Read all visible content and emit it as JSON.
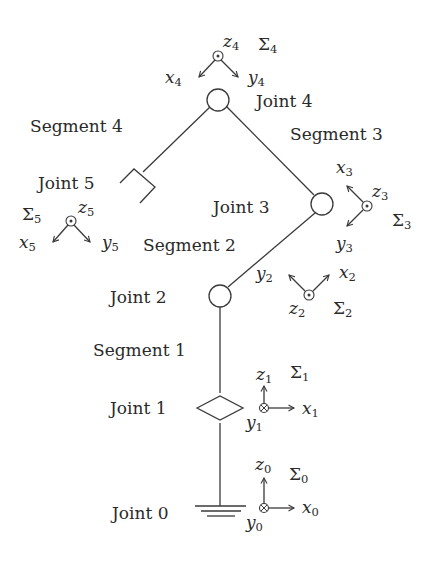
{
  "diagram": {
    "colors": {
      "ink": "#3a3a3a",
      "text": "#2a2a2a",
      "background": "#ffffff"
    },
    "joints": [
      {
        "id": "joint-0",
        "label": "Joint 0",
        "type": "ground"
      },
      {
        "id": "joint-1",
        "label": "Joint 1",
        "type": "prismatic-diamond"
      },
      {
        "id": "joint-2",
        "label": "Joint 2",
        "type": "revolute-circle"
      },
      {
        "id": "joint-3",
        "label": "Joint 3",
        "type": "revolute-circle"
      },
      {
        "id": "joint-4",
        "label": "Joint 4",
        "type": "revolute-circle"
      },
      {
        "id": "joint-5",
        "label": "Joint 5",
        "type": "gripper"
      }
    ],
    "segments": [
      {
        "id": "segment-1",
        "label": "Segment 1"
      },
      {
        "id": "segment-2",
        "label": "Segment 2"
      },
      {
        "id": "segment-3",
        "label": "Segment 3"
      },
      {
        "id": "segment-4",
        "label": "Segment 4"
      }
    ],
    "frames": [
      {
        "id": "frame-0",
        "sigma": "Σ",
        "index": "0",
        "axes": {
          "x": "x",
          "y": "y",
          "z": "z"
        },
        "out_of_page": "y",
        "symbol": "otimes"
      },
      {
        "id": "frame-1",
        "sigma": "Σ",
        "index": "1",
        "axes": {
          "x": "x",
          "y": "y",
          "z": "z"
        },
        "out_of_page": "y",
        "symbol": "otimes"
      },
      {
        "id": "frame-2",
        "sigma": "Σ",
        "index": "2",
        "axes": {
          "x": "x",
          "y": "y",
          "z": "z"
        },
        "out_of_page": "z",
        "symbol": "odot"
      },
      {
        "id": "frame-3",
        "sigma": "Σ",
        "index": "3",
        "axes": {
          "x": "x",
          "y": "y",
          "z": "z"
        },
        "out_of_page": "z",
        "symbol": "odot"
      },
      {
        "id": "frame-4",
        "sigma": "Σ",
        "index": "4",
        "axes": {
          "x": "x",
          "y": "y",
          "z": "z"
        },
        "out_of_page": "z",
        "symbol": "odot"
      },
      {
        "id": "frame-5",
        "sigma": "Σ",
        "index": "5",
        "axes": {
          "x": "x",
          "y": "y",
          "z": "z"
        },
        "out_of_page": "z",
        "symbol": "odot"
      }
    ]
  }
}
